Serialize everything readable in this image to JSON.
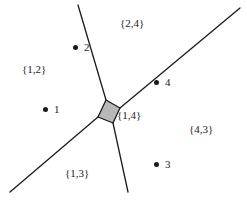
{
  "figure": {
    "width": 247,
    "height": 201,
    "background_color": "#ffffff",
    "line_color": "#1a1a1a",
    "text_color": "#1a1a1a",
    "cell_fill_color": "#b8b8b8",
    "cell_stroke_color": "#1a1a1a"
  },
  "chart_data": {
    "type": "diagram",
    "xlabel": "",
    "ylabel": "",
    "xlim": [
      0,
      247
    ],
    "ylim": [
      0,
      201
    ],
    "grid": false,
    "legend": "none",
    "sites": [
      {
        "name": "1",
        "label": "1",
        "x": 45,
        "y": 109,
        "label_x": 54,
        "label_y": 104
      },
      {
        "name": "2",
        "label": "2",
        "x": 75,
        "y": 47,
        "label_x": 84,
        "label_y": 42
      },
      {
        "name": "3",
        "label": "3",
        "x": 156,
        "y": 164,
        "label_x": 165,
        "label_y": 159
      },
      {
        "name": "4",
        "label": "4",
        "x": 156,
        "y": 82,
        "label_x": 165,
        "label_y": 77
      }
    ],
    "region_labels": [
      {
        "name": "region-1-2",
        "text": "{1,2}",
        "x": 22,
        "y": 64
      },
      {
        "name": "region-2-4",
        "text": "{2,4}",
        "x": 120,
        "y": 18
      },
      {
        "name": "region-1-4",
        "text": "{1,4}",
        "x": 117,
        "y": 110
      },
      {
        "name": "region-4-3",
        "text": "{4,3}",
        "x": 189,
        "y": 124
      },
      {
        "name": "region-1-3",
        "text": "{1,3}",
        "x": 65,
        "y": 168
      }
    ],
    "edges": [
      {
        "name": "edge-upper",
        "x1": 78,
        "y1": 5,
        "x2": 106,
        "y2": 100
      },
      {
        "name": "edge-upper-right",
        "x1": 240,
        "y1": 8,
        "x2": 120,
        "y2": 108
      },
      {
        "name": "edge-lower-left",
        "x1": 10,
        "y1": 192,
        "x2": 98,
        "y2": 117
      },
      {
        "name": "edge-lower-center",
        "x1": 128,
        "y1": 192,
        "x2": 113,
        "y2": 123
      }
    ],
    "cell_polygon": {
      "name": "central-cell",
      "points": [
        [
          106,
          100
        ],
        [
          120,
          108
        ],
        [
          113,
          123
        ],
        [
          98,
          117
        ]
      ],
      "fill": "#b8b8b8",
      "stroke": "#1a1a1a"
    }
  }
}
